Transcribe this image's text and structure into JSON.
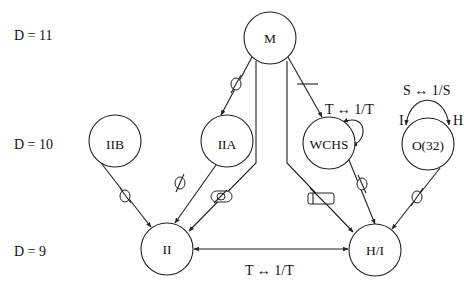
{
  "levels": [
    {
      "label": "D = 11",
      "y": 36
    },
    {
      "label": "D = 10",
      "y": 145
    },
    {
      "label": "D = 9",
      "y": 252
    }
  ],
  "nodes": {
    "M": {
      "label": "M",
      "cx": 270,
      "cy": 38,
      "r": 26
    },
    "IIB": {
      "label": "IIB",
      "cx": 115,
      "cy": 141,
      "r": 26
    },
    "IIA": {
      "label": "IIA",
      "cx": 227,
      "cy": 141,
      "r": 26
    },
    "WCHS": {
      "label": "WCHS",
      "cx": 329,
      "cy": 143,
      "r": 26
    },
    "O32": {
      "label": "O(32)",
      "cx": 428,
      "cy": 144,
      "r": 26
    },
    "II": {
      "label": "II",
      "cx": 167,
      "cy": 249,
      "r": 26
    },
    "HI": {
      "label": "H/I",
      "cx": 375,
      "cy": 250,
      "r": 26
    }
  },
  "edges": [
    {
      "from": "M",
      "to": "IIA",
      "marker": "circle"
    },
    {
      "from": "M",
      "to": "WCHS",
      "marker": "bar"
    },
    {
      "from": "M",
      "to": "II",
      "marker": "circle-with-slash-in-oval",
      "path": "trunk-left"
    },
    {
      "from": "M",
      "to": "HI",
      "marker": "cylinder",
      "path": "trunk-right"
    },
    {
      "from": "IIB",
      "to": "II",
      "marker": "circle"
    },
    {
      "from": "IIA",
      "to": "II",
      "marker": "circle"
    },
    {
      "from": "WCHS",
      "to": "HI",
      "marker": "circle"
    },
    {
      "from": "O32",
      "to": "HI",
      "marker": "circle"
    },
    {
      "from": "HI",
      "to": "II",
      "marker": "none",
      "bidirectional": true
    },
    {
      "from": "WCHS",
      "to": "WCHS",
      "marker": "self-loop"
    },
    {
      "from": "O32",
      "to": "O32",
      "marker": "arc-I-H"
    }
  ],
  "relations": {
    "wchs_duality": "T ↔ 1/T",
    "o32_duality": "S ↔ 1/S",
    "ii_hi_duality": "T ↔ 1/T",
    "o32_left_end": "I",
    "o32_right_end": "H"
  },
  "colors": {
    "stroke": "#222222",
    "background": "#ffffff",
    "text": "#111111"
  }
}
